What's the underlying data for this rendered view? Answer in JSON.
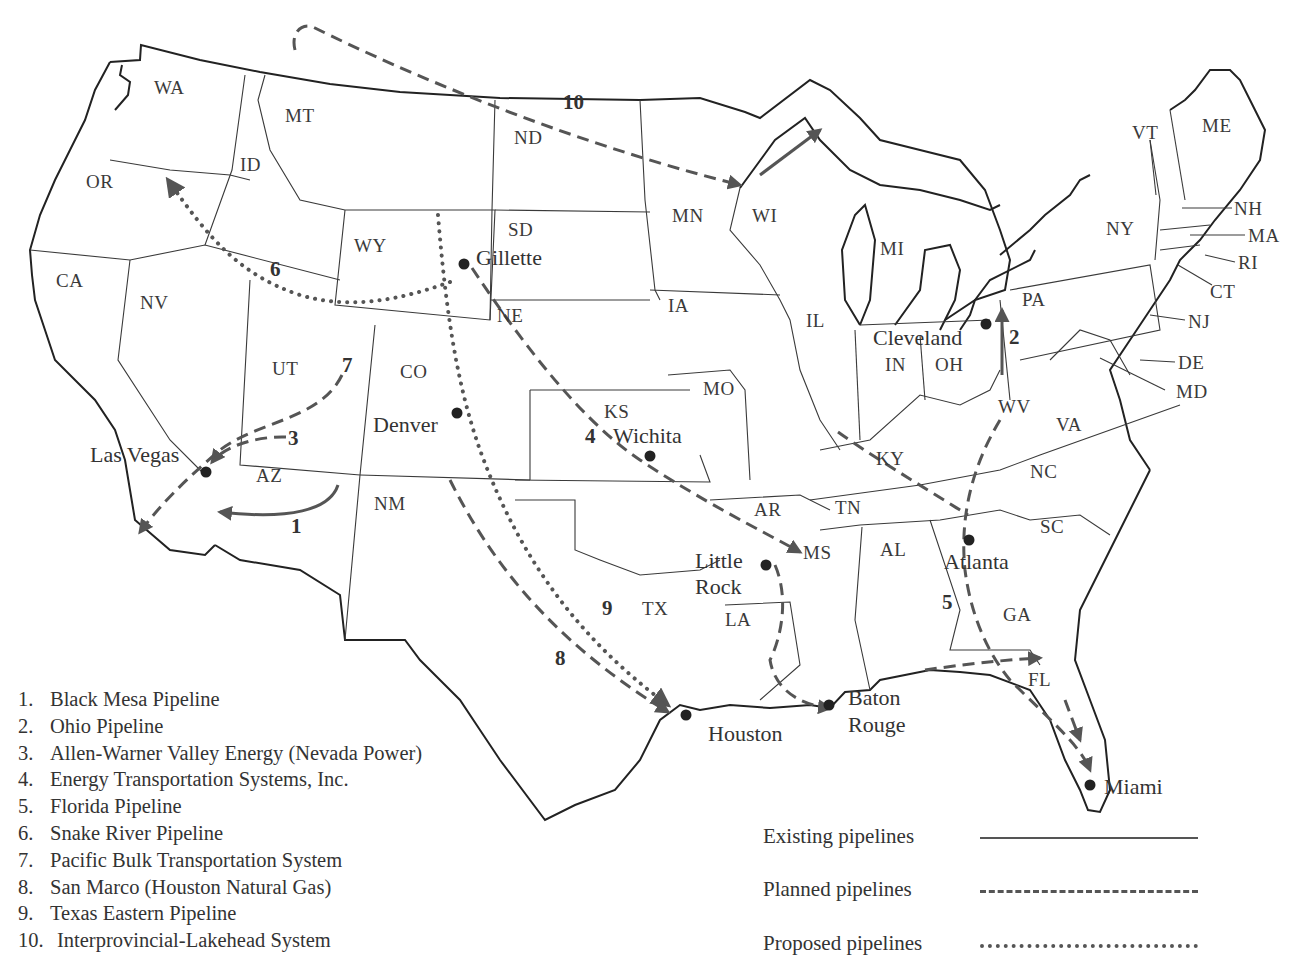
{
  "map": {
    "states": [
      "WA",
      "OR",
      "CA",
      "ID",
      "NV",
      "MT",
      "WY",
      "UT",
      "AZ",
      "CO",
      "NM",
      "ND",
      "SD",
      "NE",
      "KS",
      "TX",
      "MN",
      "IA",
      "MO",
      "AR",
      "LA",
      "WI",
      "IL",
      "MI",
      "IN",
      "OH",
      "KY",
      "TN",
      "MS",
      "AL",
      "GA",
      "FL",
      "SC",
      "NC",
      "VA",
      "WV",
      "PA",
      "NY",
      "VT",
      "NH",
      "ME",
      "MA",
      "RI",
      "CT",
      "NJ",
      "DE",
      "MD"
    ],
    "state_labels": {
      "WA": "WA",
      "OR": "OR",
      "CA": "CA",
      "ID": "ID",
      "NV": "NV",
      "MT": "MT",
      "WY": "WY",
      "UT": "UT",
      "AZ": "AZ",
      "CO": "CO",
      "NM": "NM",
      "ND": "ND",
      "SD": "SD",
      "NE": "NE",
      "KS": "KS",
      "TX": "TX",
      "MN": "MN",
      "IA": "IA",
      "MO": "MO",
      "AR": "AR",
      "LA": "LA",
      "WI": "WI",
      "IL": "IL",
      "MI": "MI",
      "IN": "IN",
      "OH": "OH",
      "KY": "KY",
      "TN": "TN",
      "MS": "MS",
      "AL": "AL",
      "GA": "GA",
      "FL": "FL",
      "SC": "SC",
      "NC": "NC",
      "VA": "VA",
      "WV": "WV",
      "PA": "PA",
      "NY": "NY",
      "VT": "VT",
      "NH": "NH",
      "ME": "ME",
      "MA": "MA",
      "RI": "RI",
      "CT": "CT",
      "NJ": "NJ",
      "DE": "DE",
      "MD": "MD"
    },
    "cities": {
      "gillette": "Gillette",
      "denver": "Denver",
      "las_vegas": "Las Vegas",
      "wichita": "Wichita",
      "cleveland": "Cleveland",
      "little_rock_1": "Little",
      "little_rock_2": "Rock",
      "atlanta": "Atlanta",
      "houston": "Houston",
      "baton_rouge_1": "Baton",
      "baton_rouge_2": "Rouge",
      "miami": "Miami"
    },
    "pipeline_numbers": {
      "p1": "1",
      "p2": "2",
      "p3": "3",
      "p4": "4",
      "p5": "5",
      "p6": "6",
      "p7": "7",
      "p8": "8",
      "p9": "9",
      "p10": "10"
    }
  },
  "legend": {
    "pipelines": [
      {
        "num": "1.",
        "name": "Black Mesa Pipeline"
      },
      {
        "num": "2.",
        "name": "Ohio Pipeline"
      },
      {
        "num": "3.",
        "name": "Allen-Warner Valley Energy (Nevada Power)"
      },
      {
        "num": "4.",
        "name": "Energy Transportation Systems, Inc."
      },
      {
        "num": "5.",
        "name": "Florida Pipeline"
      },
      {
        "num": "6.",
        "name": "Snake River Pipeline"
      },
      {
        "num": "7.",
        "name": "Pacific Bulk Transportation System"
      },
      {
        "num": "8.",
        "name": "San Marco (Houston Natural Gas)"
      },
      {
        "num": "9.",
        "name": "Texas Eastern Pipeline"
      },
      {
        "num": "10.",
        "name": "Interprovincial-Lakehead System"
      }
    ],
    "line_types": {
      "existing": "Existing pipelines",
      "planned": "Planned pipelines",
      "proposed": "Proposed pipelines"
    }
  },
  "colors": {
    "line": "#555555",
    "border": "#3a3a3a",
    "text": "#333333"
  }
}
